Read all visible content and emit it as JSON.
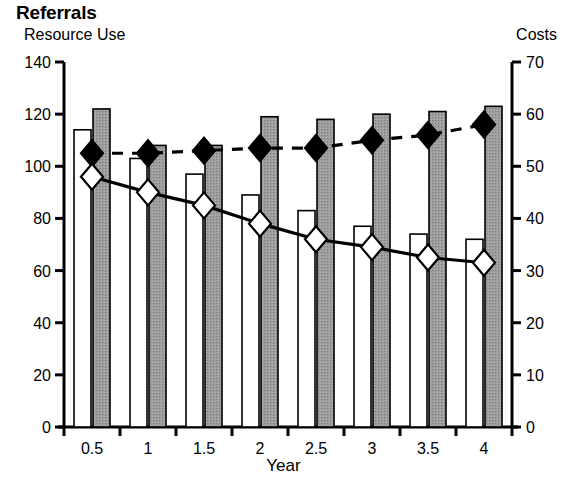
{
  "chart_data": {
    "type": "bar",
    "title": "Referrals",
    "xlabel": "Year",
    "ylabel": "Resource Use",
    "y2label": "Costs",
    "categories": [
      "0.5",
      "1",
      "1.5",
      "2",
      "2.5",
      "3",
      "3.5",
      "4"
    ],
    "ylim": [
      0,
      140
    ],
    "yticks": [
      0,
      20,
      40,
      60,
      80,
      100,
      120,
      140
    ],
    "y2lim": [
      0,
      70
    ],
    "y2ticks": [
      0,
      10,
      20,
      30,
      40,
      50,
      60,
      70
    ],
    "grid": false,
    "legend": "none",
    "series": [
      {
        "name": "Resource Use (white bar)",
        "type": "bar",
        "axis": "left",
        "fill": "#ffffff",
        "stroke": "#000000",
        "values": [
          114,
          103,
          97,
          89,
          83,
          77,
          74,
          72
        ]
      },
      {
        "name": "Resource Use (shaded bar)",
        "type": "bar",
        "axis": "left",
        "fill": "#9a9a9a",
        "stroke": "#000000",
        "values": [
          122,
          108,
          108,
          119,
          118,
          120,
          121,
          123
        ]
      },
      {
        "name": "Costs (black diamond, dashed)",
        "type": "line",
        "axis": "right",
        "line_style": "dashed",
        "marker": "diamond-filled",
        "marker_fill": "#000000",
        "values": [
          52.5,
          52.5,
          53,
          53.5,
          53.5,
          55,
          56,
          58
        ]
      },
      {
        "name": "Costs (white diamond, solid)",
        "type": "line",
        "axis": "right",
        "line_style": "solid",
        "marker": "diamond-open",
        "marker_fill": "#ffffff",
        "values": [
          48,
          45,
          42.5,
          39,
          36,
          34.5,
          32.5,
          31.5
        ]
      }
    ]
  },
  "colors": {
    "axis": "#000000",
    "bar_shaded": "#9a9a9a",
    "bar_white": "#ffffff",
    "marker_filled": "#000000",
    "marker_open": "#ffffff"
  }
}
